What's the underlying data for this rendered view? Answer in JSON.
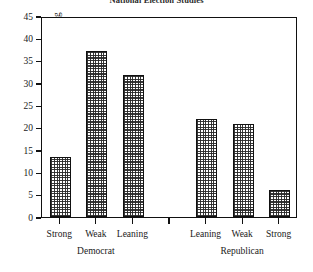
{
  "chart_data": {
    "type": "bar",
    "title": "National Election Studies",
    "xlabel": "",
    "ylabel": "Percentage Defecting",
    "ylim": [
      0,
      45
    ],
    "yticks": [
      0,
      5,
      10,
      15,
      20,
      25,
      30,
      35,
      40,
      45
    ],
    "ytick_labels": [
      "0",
      "5",
      "10",
      "15",
      "20",
      "25",
      "30",
      "35",
      "40",
      "45"
    ],
    "grid": false,
    "legend": "none",
    "categories": [
      "Strong",
      "Weak",
      "Leaning",
      "",
      "Leaning",
      "Weak",
      "Strong"
    ],
    "values": [
      13.5,
      37.1,
      31.8,
      null,
      22.0,
      20.8,
      6.0
    ],
    "groups": [
      {
        "label": "Democrat",
        "categories": [
          "Strong",
          "Weak",
          "Leaning"
        ],
        "values": [
          13.5,
          37.1,
          31.8
        ]
      },
      {
        "label": "Republican",
        "categories": [
          "Leaning",
          "Weak",
          "Strong"
        ],
        "values": [
          22.0,
          20.8,
          6.0
        ]
      }
    ],
    "bars": [
      {
        "category": "Strong",
        "group": "Democrat",
        "value": 13.5,
        "slot": 0
      },
      {
        "category": "Weak",
        "group": "Democrat",
        "value": 37.1,
        "slot": 1
      },
      {
        "category": "Leaning",
        "group": "Democrat",
        "value": 31.8,
        "slot": 2
      },
      {
        "category": "Leaning",
        "group": "Republican",
        "value": 22.0,
        "slot": 4
      },
      {
        "category": "Weak",
        "group": "Republican",
        "value": 20.8,
        "slot": 5
      },
      {
        "category": "Strong",
        "group": "Republican",
        "value": 6.0,
        "slot": 6
      }
    ],
    "group_labels": [
      {
        "label": "Democrat",
        "slot_center": 1
      },
      {
        "label": "Republican",
        "slot_center": 5
      }
    ],
    "colors": {
      "bar_fill": "#4a4a4a",
      "bar_edge": "#111111",
      "axis": "#111111",
      "background": "#ffffff",
      "text": "#1a1a1a"
    }
  }
}
